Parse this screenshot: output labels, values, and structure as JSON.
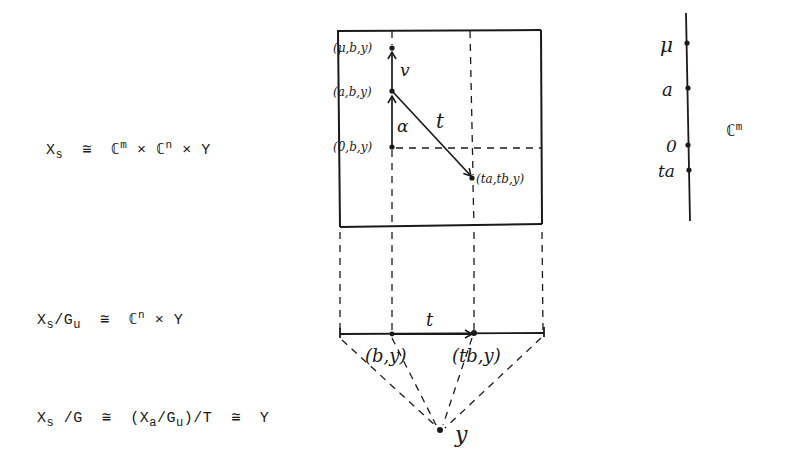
{
  "equations": {
    "eq1": {
      "lhs": "X",
      "lhs_sub": "s",
      "rel": "≅",
      "t1": "ℂ",
      "t1_sup": "m",
      "times1": "×",
      "t2": "ℂ",
      "t2_sup": "n",
      "times2": "×",
      "t3": "Y"
    },
    "eq2": {
      "lhs": "X",
      "lhs_sub": "s",
      "slash": "/G",
      "g_sub": "u",
      "rel": "≅",
      "t1": "ℂ",
      "t1_sup": "n",
      "times1": "×",
      "t2": "Y"
    },
    "eq3": {
      "lhs": "X",
      "lhs_sub": "s",
      "slash": "/G",
      "rel1": "≅",
      "open": "(X",
      "a_sub": "a",
      "mid": "/G",
      "u_sub": "u",
      "close": ")/T",
      "rel2": "≅",
      "t": "Y"
    }
  },
  "square_labels": {
    "mu_point": "(μ,b,y)",
    "a_point": "(a,b,y)",
    "zero_point": "(0,b,y)",
    "ta_point": "(ta,tb,y)",
    "v_arrow": "v",
    "alpha_arrow": "α",
    "t_arrow": "t"
  },
  "base_labels": {
    "t_arrow": "t",
    "b_point": "(b,y)",
    "tb_point": "(tb,y)",
    "y_point": "y"
  },
  "axis": {
    "points": [
      "μ",
      "a",
      "0",
      "ta"
    ],
    "label": "ℂ",
    "label_sup": "m"
  },
  "colors": {
    "ink": "#1a1a1a",
    "paper": "#ffffff"
  }
}
